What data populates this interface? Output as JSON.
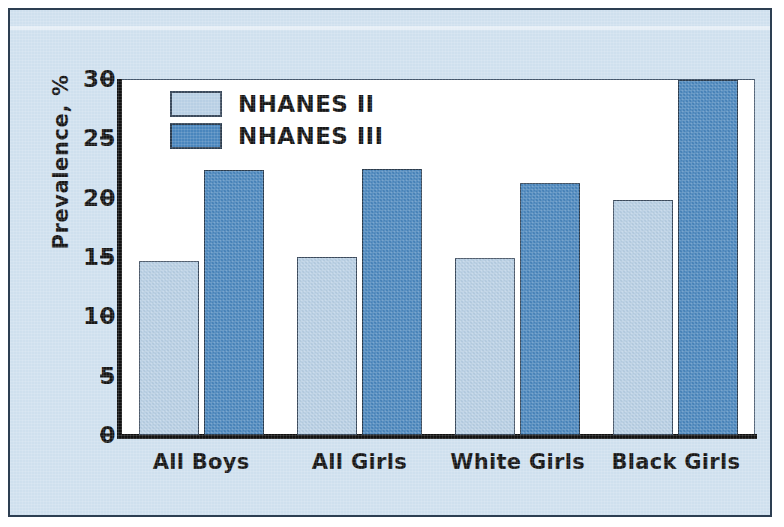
{
  "chart_data": {
    "type": "bar",
    "title": "",
    "xlabel": "",
    "ylabel": "Prevalence, %",
    "categories": [
      "All Boys",
      "All Girls",
      "White Girls",
      "Black Girls"
    ],
    "series": [
      {
        "name": "NHANES II",
        "color": "#b8cfe4",
        "values": [
          14.7,
          15.0,
          14.9,
          19.8
        ]
      },
      {
        "name": "NHANES III",
        "color": "#4a86bd",
        "values": [
          22.3,
          22.4,
          21.2,
          29.9
        ]
      }
    ],
    "ylim": [
      0,
      30
    ],
    "yticks": [
      0,
      5,
      10,
      15,
      20,
      25,
      30
    ],
    "ytick_labels": [
      "0",
      "5",
      "10",
      "15",
      "20",
      "25",
      "30"
    ],
    "grid": false,
    "legend_position": "top-left"
  },
  "figure": {
    "background_color": "#cfe0ee",
    "plot_background_color": "#ffffff",
    "border_color": "#2d3f52",
    "axis_color": "#111111",
    "text_color": "#161616"
  }
}
